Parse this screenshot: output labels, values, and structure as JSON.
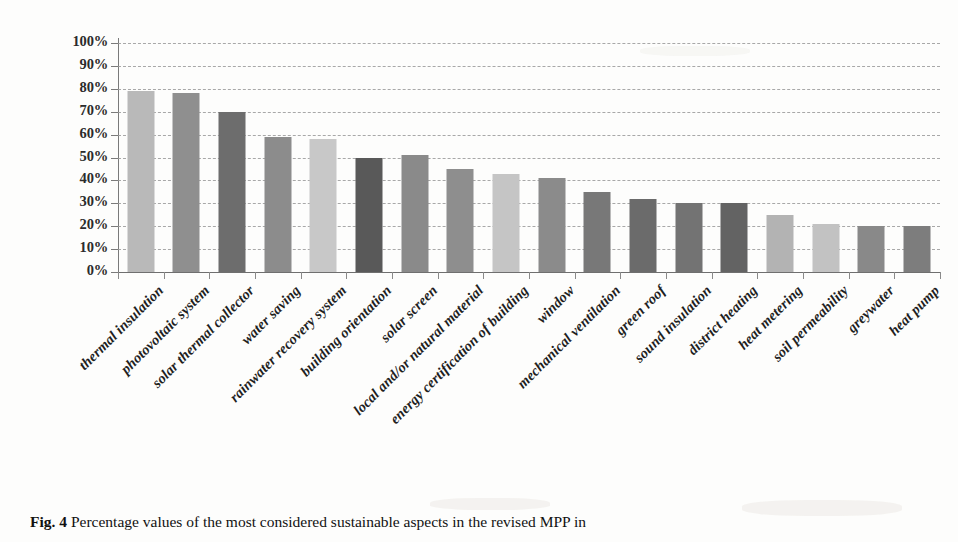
{
  "figure": {
    "caption_label": "Fig. 4",
    "caption_text": "Percentage values of the most considered sustainable aspects in the revised MPP in"
  },
  "chart_data": {
    "type": "bar",
    "title": "",
    "xlabel": "",
    "ylabel": "",
    "ylim": [
      0,
      100
    ],
    "grid": true,
    "legend": "none",
    "orientation": "vertical",
    "y_tick_labels": [
      "100%",
      "90%",
      "80%",
      "70%",
      "60%",
      "50%",
      "40%",
      "30%",
      "20%",
      "10%",
      "0%"
    ],
    "y_tick_values": [
      100,
      90,
      80,
      70,
      60,
      50,
      40,
      30,
      20,
      10,
      0
    ],
    "categories": [
      "thermal insulation",
      "photovoltaic system",
      "solar thermal collector",
      "water saving",
      "rainwater recovery system",
      "building orientation",
      "solar screen",
      "local and/or natural material",
      "energy certification of building",
      "window",
      "mechanical ventilation",
      "green roof",
      "sound insulation",
      "district heating",
      "heat metering",
      "soil permeability",
      "greywater",
      "heat pump"
    ],
    "values": [
      79,
      78,
      70,
      59,
      58,
      50,
      51,
      45,
      43,
      41,
      35,
      32,
      30,
      30,
      25,
      21,
      20,
      20
    ],
    "bar_colors": [
      "#b9b9b9",
      "#8f8f8f",
      "#6d6d6d",
      "#8c8c8c",
      "#c8c8c8",
      "#595959",
      "#8a8a8a",
      "#8e8e8e",
      "#c5c5c5",
      "#8b8b8b",
      "#787878",
      "#6b6b6b",
      "#737373",
      "#636363",
      "#b3b3b3",
      "#c2c2c2",
      "#898989",
      "#7d7d7d"
    ]
  }
}
